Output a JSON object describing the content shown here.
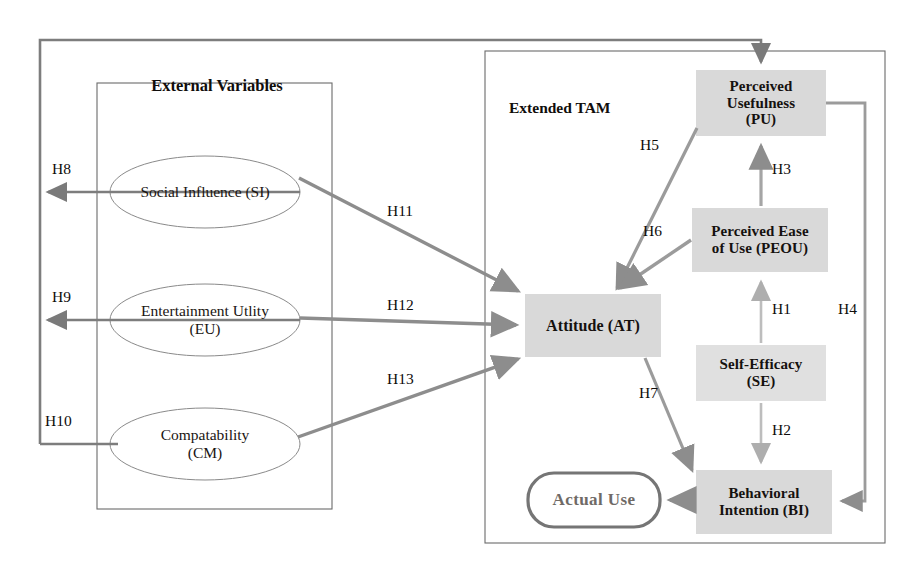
{
  "diagram": {
    "colors": {
      "box_fill": "#d8d8d8",
      "box_fill_light": "#e2e2e2",
      "arrow_gray": "#8d8d8d",
      "arrow_dark": "#6f6f6f",
      "border_thin": "#6b6b6b",
      "text": "#100d0b",
      "actual_use_text": "#6f6a66"
    },
    "groups": [
      {
        "id": "external-variables",
        "label": "External Variables"
      },
      {
        "id": "extended-tam",
        "label": "Extended TAM"
      }
    ],
    "external_variables": [
      {
        "id": "si",
        "line1": "Social Influence (SI)",
        "line2": ""
      },
      {
        "id": "eu",
        "line1": "Entertainment Utlity",
        "line2": "(EU)"
      },
      {
        "id": "cm",
        "line1": "Compatability",
        "line2": "(CM)"
      }
    ],
    "constructs": [
      {
        "id": "pu",
        "line1": "Perceived",
        "line2": "Usefulness",
        "line3": "(PU)"
      },
      {
        "id": "peou",
        "line1": "Perceived Ease",
        "line2": "of Use (PEOU)",
        "line3": ""
      },
      {
        "id": "se",
        "line1": "Self-Efficacy",
        "line2": "(SE)",
        "line3": ""
      },
      {
        "id": "at",
        "line1": "Attitude (AT)",
        "line2": "",
        "line3": ""
      },
      {
        "id": "bi",
        "line1": "Behavioral",
        "line2": "Intention (BI)",
        "line3": ""
      }
    ],
    "outcome": {
      "id": "actual-use",
      "label": "Actual Use"
    },
    "hypotheses": [
      {
        "id": "h1",
        "label": "H1",
        "from": "se",
        "to": "peou"
      },
      {
        "id": "h2",
        "label": "H2",
        "from": "se",
        "to": "bi"
      },
      {
        "id": "h3",
        "label": "H3",
        "from": "peou",
        "to": "pu"
      },
      {
        "id": "h4",
        "label": "H4",
        "from": "pu",
        "to": "bi"
      },
      {
        "id": "h5",
        "label": "H5",
        "from": "pu",
        "to": "at"
      },
      {
        "id": "h6",
        "label": "H6",
        "from": "peou",
        "to": "at"
      },
      {
        "id": "h7",
        "label": "H7",
        "from": "at",
        "to": "bi"
      },
      {
        "id": "h8",
        "label": "H8",
        "from": "si",
        "to": "pu"
      },
      {
        "id": "h9",
        "label": "H9",
        "from": "eu",
        "to": "pu"
      },
      {
        "id": "h10",
        "label": "H10",
        "from": "cm",
        "to": "pu"
      },
      {
        "id": "h11",
        "label": "H11",
        "from": "si",
        "to": "at"
      },
      {
        "id": "h12",
        "label": "H12",
        "from": "eu",
        "to": "at"
      },
      {
        "id": "h13",
        "label": "H13",
        "from": "cm",
        "to": "at"
      }
    ]
  }
}
